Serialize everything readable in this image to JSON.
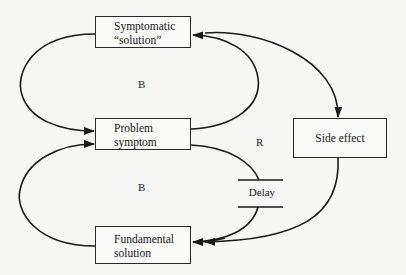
{
  "diagram": {
    "type": "causal-loop",
    "nodes": {
      "symptomatic_solution": {
        "line1": "Symptomatic",
        "line2": "“solution”"
      },
      "problem_symptom": {
        "line1": "Problem",
        "line2": "symptom"
      },
      "fundamental_solution": {
        "line1": "Fundamental",
        "line2": "solution"
      },
      "side_effect": {
        "line1": "Side effect"
      }
    },
    "loop_labels": {
      "balancing_top": "B",
      "balancing_bottom": "B",
      "reinforcing": "R"
    },
    "delay_label": "Delay",
    "edges": [
      {
        "from": "Symptomatic “solution”",
        "to": "Problem symptom"
      },
      {
        "from": "Problem symptom",
        "to": "Symptomatic “solution”"
      },
      {
        "from": "Symptomatic “solution”",
        "to": "Side effect"
      },
      {
        "from": "Side effect",
        "to": "Fundamental solution"
      },
      {
        "from": "Problem symptom",
        "to": "Fundamental solution",
        "delay": true
      },
      {
        "from": "Fundamental solution",
        "to": "Problem symptom"
      }
    ],
    "colors": {
      "line": "#1a1a1a",
      "background": "#f7f7f5"
    }
  }
}
